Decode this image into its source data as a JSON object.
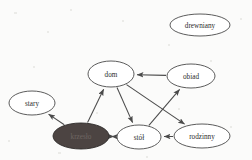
{
  "diagram": {
    "background_color": "#fbfbfa",
    "node_stroke_color": "#4a4a4a",
    "node_fill_color": "#ffffff",
    "highlight_fill_color": "#4c4442",
    "edge_color": "#4a4a4a",
    "nodes": [
      {
        "id": "drewniany",
        "label": "drewniany",
        "cx": 200,
        "cy": 25,
        "rx": 30,
        "ry": 11,
        "filled": false
      },
      {
        "id": "dom",
        "label": "dom",
        "cx": 111,
        "cy": 74,
        "rx": 23,
        "ry": 13,
        "filled": false
      },
      {
        "id": "obiad",
        "label": "obiad",
        "cx": 191,
        "cy": 76,
        "rx": 24,
        "ry": 12,
        "filled": false
      },
      {
        "id": "stary",
        "label": "stary",
        "cx": 32,
        "cy": 103,
        "rx": 23,
        "ry": 12,
        "filled": false
      },
      {
        "id": "krzeslo",
        "label": "krzesło",
        "cx": 81,
        "cy": 136,
        "rx": 28,
        "ry": 13,
        "filled": true
      },
      {
        "id": "stol",
        "label": "stół",
        "cx": 139,
        "cy": 137,
        "rx": 22,
        "ry": 12,
        "filled": false
      },
      {
        "id": "rodzinny",
        "label": "rodzinny",
        "cx": 202,
        "cy": 136,
        "rx": 28,
        "ry": 12,
        "filled": false
      }
    ],
    "edges": [
      {
        "id": "obiad-dom",
        "from": "obiad",
        "to": "dom",
        "direction": "forward"
      },
      {
        "id": "krzeslo-dom",
        "from": "krzeslo",
        "to": "dom",
        "direction": "forward"
      },
      {
        "id": "dom-stol",
        "from": "dom",
        "to": "stol",
        "direction": "forward"
      },
      {
        "id": "dom-rodzinny",
        "from": "dom",
        "to": "rodzinny",
        "direction": "forward"
      },
      {
        "id": "stol-obiad",
        "from": "stol",
        "to": "obiad",
        "direction": "forward"
      },
      {
        "id": "rodzinny-stol",
        "from": "rodzinny",
        "to": "stol",
        "direction": "forward"
      },
      {
        "id": "krzeslo-stary",
        "from": "krzeslo",
        "to": "stary",
        "direction": "forward"
      },
      {
        "id": "krzeslo-stol",
        "from": "krzeslo",
        "to": "stol",
        "direction": "both"
      }
    ]
  }
}
